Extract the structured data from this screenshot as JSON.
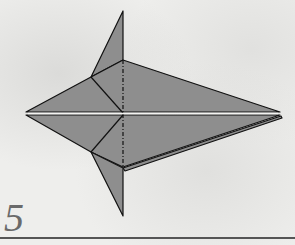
{
  "step": {
    "number": "5"
  },
  "colors": {
    "paper_fill": "#8e8e8e",
    "line": "#111111",
    "background": "#eeeeec"
  },
  "diagram": {
    "points": {
      "top_tip": [
        123,
        11
      ],
      "top_fin_junction": [
        123,
        60
      ],
      "left_fin_point_top": [
        91,
        77
      ],
      "center": [
        123,
        113
      ],
      "left_tip": [
        26,
        112
      ],
      "right_tip": [
        280,
        113
      ],
      "left_fin_point_bottom": [
        91,
        152
      ],
      "bottom_fin_junction": [
        123,
        168
      ],
      "bottom_tip": [
        123,
        216
      ]
    },
    "lines": [
      "solid edges",
      "dash-dot valley/mountain line at x=123"
    ]
  }
}
